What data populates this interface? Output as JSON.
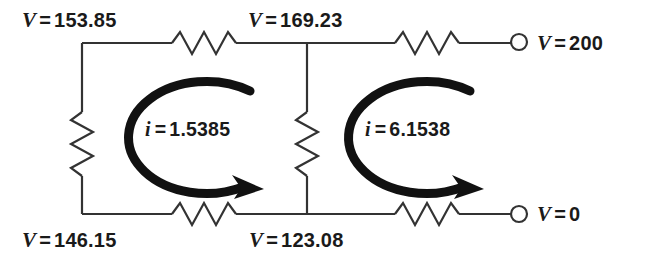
{
  "diagram": {
    "stroke_color": "#333333",
    "arrow_color": "#111111",
    "text_color": "#1a1a1a",
    "background": "#ffffff"
  },
  "node_labels": [
    {
      "id": "node-top-left",
      "symbol": "V",
      "equals": "=",
      "value": "153.85"
    },
    {
      "id": "node-top-middle",
      "symbol": "V",
      "equals": "=",
      "value": "169.23"
    },
    {
      "id": "node-top-right",
      "symbol": "V",
      "equals": "=",
      "value": "200"
    },
    {
      "id": "node-bottom-left",
      "symbol": "V",
      "equals": "=",
      "value": "146.15"
    },
    {
      "id": "node-bottom-middle",
      "symbol": "V",
      "equals": "=",
      "value": "123.08"
    },
    {
      "id": "node-bottom-right",
      "symbol": "V",
      "equals": "=",
      "value": "0"
    }
  ],
  "mesh_currents": [
    {
      "id": "mesh-current-left",
      "symbol": "i",
      "equals": "=",
      "value": "1.5385",
      "direction": "clockwise"
    },
    {
      "id": "mesh-current-right",
      "symbol": "i",
      "equals": "=",
      "value": "6.1538",
      "direction": "clockwise"
    }
  ],
  "components": {
    "resistors": [
      {
        "id": "resistor-top-left",
        "orientation": "horizontal"
      },
      {
        "id": "resistor-top-right",
        "orientation": "horizontal"
      },
      {
        "id": "resistor-bottom-left",
        "orientation": "horizontal"
      },
      {
        "id": "resistor-bottom-right",
        "orientation": "horizontal"
      },
      {
        "id": "resistor-left-vertical",
        "orientation": "vertical"
      },
      {
        "id": "resistor-middle-vertical",
        "orientation": "vertical"
      }
    ],
    "terminals": [
      {
        "id": "terminal-top-right",
        "shape": "open-circle"
      },
      {
        "id": "terminal-bottom-right",
        "shape": "open-circle"
      }
    ]
  }
}
